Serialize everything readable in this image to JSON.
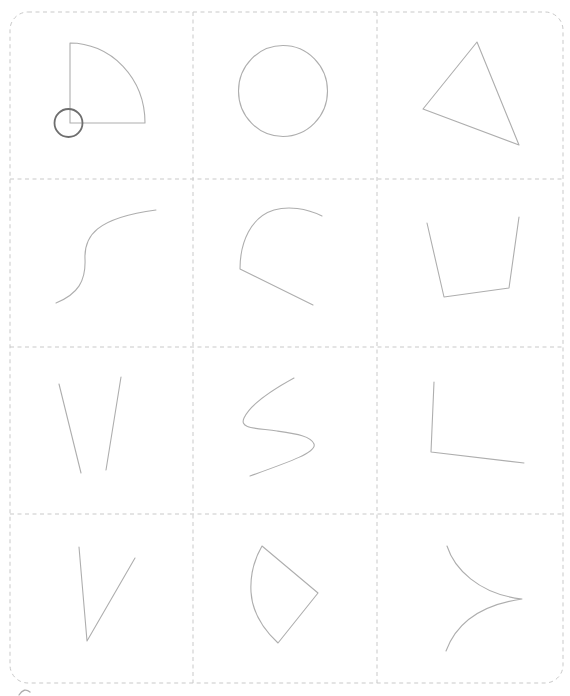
{
  "canvas": {
    "width": 570,
    "height": 696,
    "background": "#ffffff"
  },
  "board": {
    "x": 10,
    "y": 12,
    "width": 553,
    "height": 671,
    "corner_radius": 18,
    "border_color": "#c9c9c9",
    "dash": "4 3.5",
    "grid": {
      "columns": 3,
      "rows": 4,
      "vertical_lines_x": [
        193,
        377
      ],
      "horizontal_lines_y": [
        179,
        347,
        514
      ]
    }
  },
  "stroke": {
    "default_color": "#aeaeae",
    "default_width": 1.1,
    "accent_color": "#6e6e6e",
    "accent_width": 1.8
  },
  "cells": [
    {
      "row": 1,
      "col": 1,
      "name": "quarter-sector-with-circle",
      "description": "quarter-circle pie slice with small dark circle centered on its corner",
      "elements": [
        {
          "type": "path",
          "d": "M 70 43 A 75 80 0 0 1 145 123 L 70 123 Z"
        },
        {
          "type": "circle",
          "cx": 68.5,
          "cy": 123,
          "r": 14,
          "color": "#6e6e6e",
          "width": 1.8
        }
      ]
    },
    {
      "row": 1,
      "col": 2,
      "name": "circle",
      "description": "outlined circle",
      "elements": [
        {
          "type": "ellipse",
          "cx": 283,
          "cy": 91,
          "rx": 44.5,
          "ry": 45.5
        }
      ]
    },
    {
      "row": 1,
      "col": 3,
      "name": "triangle",
      "description": "scalene triangle tilted left",
      "elements": [
        {
          "type": "path",
          "d": "M 477 42 L 423 109 L 519 145 Z"
        }
      ]
    },
    {
      "row": 2,
      "col": 1,
      "name": "s-curve",
      "description": "open S-shaped stroke rising to the right",
      "elements": [
        {
          "type": "path",
          "d": "M 56 303 C 78 294 86 281 85 259 C 84 236 96 218 156 210"
        }
      ]
    },
    {
      "row": 2,
      "col": 2,
      "name": "hook-curve",
      "description": "arc sweeping from upper right over the top, down left, then straight tail to lower right",
      "elements": [
        {
          "type": "path",
          "d": "M 322 216 C 306 208 288 206 274 210 C 251 217 240 242 240 269 L 313 305"
        }
      ]
    },
    {
      "row": 2,
      "col": 3,
      "name": "open-trapezoid",
      "description": "bucket-like open trapezoid, open at the top",
      "elements": [
        {
          "type": "path",
          "d": "M 427 223 L 444 297 L 509 288 L 519 217"
        }
      ]
    },
    {
      "row": 3,
      "col": 1,
      "name": "two-slanted-lines",
      "description": "two converging slanted lines not joined at the bottom",
      "elements": [
        {
          "type": "line",
          "x1": 59,
          "y1": 384,
          "x2": 81,
          "y2": 473
        },
        {
          "type": "line",
          "x1": 121,
          "y1": 377,
          "x2": 106,
          "y2": 470
        }
      ]
    },
    {
      "row": 3,
      "col": 2,
      "name": "s-wave",
      "description": "letter-S-like wave stroke",
      "elements": [
        {
          "type": "path",
          "d": "M 294 378 C 272 390 250 405 244 418 C 239 429 256 428 277 431 C 297 434 311 436 314 444 C 317 452 292 461 250 476"
        }
      ]
    },
    {
      "row": 3,
      "col": 3,
      "name": "l-angle",
      "description": "L-shaped angle, horizontal arm sloping slightly down to the right",
      "elements": [
        {
          "type": "path",
          "d": "M 434 382 L 431 452 L 524 463"
        }
      ]
    },
    {
      "row": 4,
      "col": 1,
      "name": "v-shape",
      "description": "narrow V joined at the bottom",
      "elements": [
        {
          "type": "path",
          "d": "M 79 547 L 87 641 L 135 558"
        }
      ]
    },
    {
      "row": 4,
      "col": 2,
      "name": "fan-sector",
      "description": "closed fan / shield sector pointing right with curved left edge",
      "elements": [
        {
          "type": "path",
          "d": "M 262 546 L 318 593 L 278 643 C 262 628 252 610 251 592 C 250 574 255 558 262 546 Z"
        }
      ]
    },
    {
      "row": 4,
      "col": 3,
      "name": "cusp-curve",
      "description": "two concave arcs meeting in a sharp cusp pointing right",
      "elements": [
        {
          "type": "path",
          "d": "M 447 546 C 454 568 478 594 522 599 C 480 605 456 624 446 651"
        }
      ]
    }
  ],
  "stray_marks": [
    {
      "name": "stray-pen-mark",
      "description": "tiny faint curl clipped at the bottom-left image edge",
      "elements": [
        {
          "type": "path",
          "d": "M 19 695 Q 24 687 30 692",
          "width": 1.3
        }
      ]
    }
  ]
}
